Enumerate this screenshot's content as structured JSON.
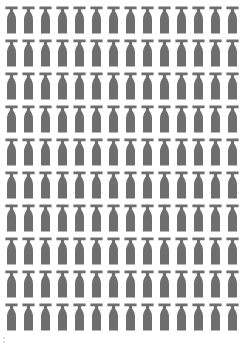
{
  "figure": {
    "type": "pictogram",
    "title": "",
    "background_color": "#ffffff",
    "icon_color": "#6e6e6e",
    "icon_name": "bottle-icon",
    "icon_semantic": "bottle",
    "canvas": {
      "width": 243,
      "height": 346
    }
  },
  "chart_data": {
    "type": "pictogram",
    "title": "",
    "subtitle": "",
    "xlabel": "",
    "ylabel": "",
    "legend": [],
    "annotations": [],
    "grid": false,
    "icon": "bottle",
    "icon_color": "#6e6e6e",
    "unit_per_icon": 1,
    "columns": 14,
    "rows": 10,
    "total_icons": 140,
    "row_counts": [
      14,
      14,
      14,
      14,
      14,
      14,
      14,
      14,
      14,
      14
    ],
    "categories": [
      "row-1",
      "row-2",
      "row-3",
      "row-4",
      "row-5",
      "row-6",
      "row-7",
      "row-8",
      "row-9",
      "row-10"
    ],
    "values": [
      14,
      14,
      14,
      14,
      14,
      14,
      14,
      14,
      14,
      14
    ]
  },
  "layout": {
    "origin_x": 5,
    "origin_y": 6,
    "column_pitch": 17.0,
    "row_pitch": 33.0,
    "icon_width": 13,
    "icon_height": 28
  },
  "artifact": {
    "name": "bottom-left-speck",
    "visible": true
  }
}
